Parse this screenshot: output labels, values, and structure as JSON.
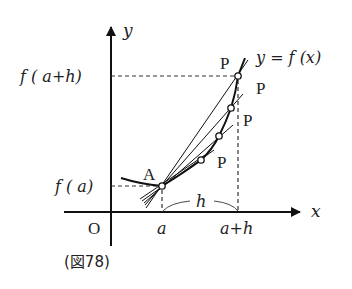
{
  "figure": {
    "caption": "(図78)",
    "axis_labels": {
      "x": "x",
      "y": "y",
      "origin": "O"
    },
    "curve_label": "y = f (x)",
    "tick_labels": {
      "a": "a",
      "a_plus_h": "a+h"
    },
    "value_labels": {
      "f_a": "f ( a)",
      "f_a_plus_h": "f ( a+h)"
    },
    "interval_label": "h",
    "point_labels": {
      "A": "A",
      "P": [
        "P",
        "P",
        "P",
        "P"
      ]
    }
  }
}
